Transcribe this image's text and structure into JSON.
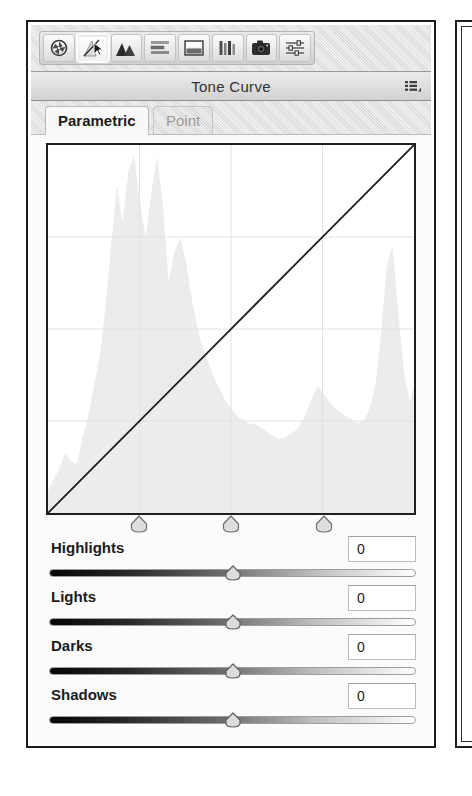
{
  "panel": {
    "title": "Tone Curve",
    "menu_icon": "list-menu-icon"
  },
  "toolbar": {
    "buttons": [
      {
        "name": "basic-module-icon",
        "label": "Basic",
        "active": false
      },
      {
        "name": "tone-curve-module-icon",
        "label": "Tone Curve",
        "active": true
      },
      {
        "name": "hsl-module-icon",
        "label": "HSL / Color",
        "active": false
      },
      {
        "name": "split-toning-icon",
        "label": "Split Toning",
        "active": false
      },
      {
        "name": "detail-module-icon",
        "label": "Detail",
        "active": false
      },
      {
        "name": "lens-correction-icon",
        "label": "Lens Correction",
        "active": false
      },
      {
        "name": "camera-calibration-icon",
        "label": "Camera Calibration",
        "active": false
      },
      {
        "name": "effects-module-icon",
        "label": "Effects",
        "active": false
      }
    ]
  },
  "tabs": [
    {
      "label": "Parametric",
      "active": true
    },
    {
      "label": "Point",
      "active": false
    }
  ],
  "sliders": [
    {
      "label": "Highlights",
      "value": "0",
      "position": 50
    },
    {
      "label": "Lights",
      "value": "0",
      "position": 50
    },
    {
      "label": "Darks",
      "value": "0",
      "position": 50
    },
    {
      "label": "Shadows",
      "value": "0",
      "position": 50
    }
  ],
  "split_points": [
    {
      "name": "shadow-split-marker",
      "position": 25
    },
    {
      "name": "midtone-split-marker",
      "position": 50
    },
    {
      "name": "highlight-split-marker",
      "position": 75
    }
  ],
  "chart_data": {
    "type": "line",
    "title": "Tone Curve",
    "xlabel": "Input",
    "ylabel": "Output",
    "xlim": [
      0,
      255
    ],
    "ylim": [
      0,
      255
    ],
    "grid": true,
    "grid_divisions": 4,
    "curve_color": "#1f1f1f",
    "histogram_color": "#ececec",
    "series": [
      {
        "name": "tone-curve",
        "note": "linear identity curve (no adjustment)",
        "x": [
          0,
          64,
          128,
          192,
          255
        ],
        "y": [
          0,
          64,
          128,
          192,
          255
        ]
      }
    ],
    "histogram": {
      "name": "image-histogram",
      "x": [
        0,
        4,
        8,
        12,
        16,
        20,
        24,
        28,
        32,
        36,
        40,
        44,
        48,
        52,
        56,
        60,
        64,
        68,
        72,
        76,
        80,
        84,
        88,
        92,
        96,
        100,
        104,
        108,
        112,
        116,
        120,
        124,
        128,
        132,
        136,
        140,
        144,
        148,
        152,
        156,
        160,
        164,
        168,
        172,
        176,
        180,
        184,
        188,
        192,
        196,
        200,
        204,
        208,
        212,
        216,
        220,
        224,
        228,
        232,
        236,
        240,
        244,
        248,
        252,
        255
      ],
      "y": [
        6,
        9,
        12,
        16,
        14,
        13,
        20,
        26,
        34,
        42,
        55,
        72,
        88,
        78,
        92,
        96,
        84,
        74,
        86,
        96,
        83,
        62,
        70,
        74,
        68,
        58,
        50,
        44,
        40,
        36,
        33,
        30,
        28,
        26,
        25,
        24,
        24,
        23,
        22,
        21,
        20,
        20,
        21,
        22,
        24,
        27,
        31,
        34,
        32,
        30,
        28,
        27,
        26,
        25,
        24,
        25,
        28,
        34,
        48,
        66,
        72,
        54,
        38,
        30,
        34
      ]
    }
  }
}
